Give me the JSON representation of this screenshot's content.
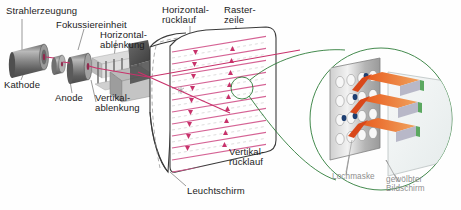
{
  "figure": {
    "background_color": "#fefefe",
    "beam_color": "#c8326b",
    "raster_color": "#d2568c",
    "callout_color": "#2f7d3a",
    "metal_color": "#8c8c8c",
    "phosphor_beam_color": "#e0621c",
    "label_color": "#1b1b1b",
    "label_color_secondary": "#8e8e8e"
  },
  "labels": {
    "beam_generation": "Strahlerzeugung",
    "focus_unit": "Fokussiereinheit",
    "horizontal_deflection_line1": "Horizontal-",
    "horizontal_deflection_line2": "ablenkung",
    "horizontal_retrace_line1": "Horizontal-",
    "horizontal_retrace_line2": "rücklauf",
    "raster_line_line1": "Raster-",
    "raster_line_line2": "zeile",
    "cathode": "Kathode",
    "anode": "Anode",
    "vertical_deflection_line1": "Vertikal-",
    "vertical_deflection_line2": "ablenkung",
    "vertical_retrace_line1": "Vertikal-",
    "vertical_retrace_line2": "rücklauf",
    "phosphor_screen": "Leuchtschirm",
    "shadow_mask": "Lochmaske",
    "curved_screen_line1": "gewölbter",
    "curved_screen_line2": "Bildschirm"
  },
  "diagram": {
    "components": [
      {
        "name": "cathode",
        "label": "Kathode",
        "kind": "cylinder"
      },
      {
        "name": "anode",
        "label": "Anode",
        "kind": "disc"
      },
      {
        "name": "focus-unit",
        "label": "Fokussiereinheit",
        "kind": "cylinder"
      },
      {
        "name": "vertical-deflection",
        "label": "Vertikal-ablenkung",
        "kind": "plates"
      },
      {
        "name": "horizontal-deflection",
        "label": "Horizontal-ablenkung",
        "kind": "plates"
      },
      {
        "name": "funnel",
        "label": "",
        "kind": "funnel"
      },
      {
        "name": "phosphor-screen",
        "label": "Leuchtschirm",
        "kind": "screen"
      },
      {
        "name": "shadow-mask",
        "label": "Lochmaske",
        "kind": "perforated-plate"
      },
      {
        "name": "curved-screen",
        "label": "gewölbter Bildschirm",
        "kind": "glass-panel"
      }
    ],
    "raster": {
      "scan_line_count": 11,
      "retrace_arrow_columns": 2,
      "arrow_count_per_column": 9
    },
    "magnifier": {
      "source_circle_radius": 11,
      "detail_circle_radius": 71,
      "beam_count": 3,
      "mask_hole_rows": 4,
      "mask_hole_cols": 5
    }
  }
}
